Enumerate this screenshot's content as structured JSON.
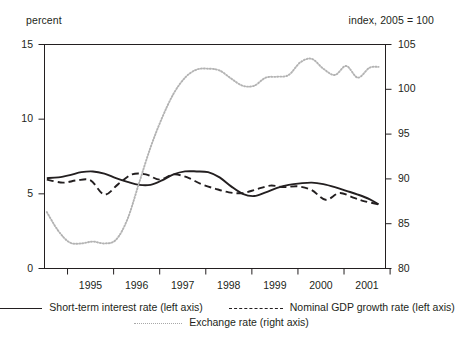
{
  "chart_data": {
    "type": "line",
    "title": "",
    "subtitle": "",
    "left_axis_caption": "percent",
    "right_axis_caption": "index, 2005 = 100",
    "xlabel": "",
    "ylabel": "percent",
    "y2label": "index, 2005 = 100",
    "grid": false,
    "legend_position": "bottom",
    "xlim": [
      1994.5,
      2001.9
    ],
    "ylim": [
      0,
      15
    ],
    "y2lim": [
      80,
      105
    ],
    "yticks": [
      0,
      5,
      10,
      15
    ],
    "y2ticks": [
      80,
      85,
      90,
      95,
      100,
      105
    ],
    "xticks": [
      1995,
      1996,
      1997,
      1998,
      1999,
      2000,
      2001
    ],
    "xticklabels": [
      "1995",
      "1996",
      "1997",
      "1998",
      "1999",
      "2000",
      "2001"
    ],
    "series": [
      {
        "name": "Short-term interest rate (left axis)",
        "axis": "left",
        "style": "solid",
        "color": "#231f20",
        "x": [
          1994.55,
          1994.8,
          1995.05,
          1995.3,
          1995.55,
          1995.8,
          1996.05,
          1996.3,
          1996.55,
          1996.8,
          1997.05,
          1997.3,
          1997.55,
          1997.8,
          1998.05,
          1998.3,
          1998.55,
          1998.8,
          1999.05,
          1999.3,
          1999.55,
          1999.8,
          2000.05,
          2000.3,
          2000.55,
          2000.8,
          2001.05,
          2001.3,
          2001.55,
          2001.75
        ],
        "values": [
          6.05,
          6.1,
          6.25,
          6.45,
          6.5,
          6.35,
          6.05,
          5.8,
          5.6,
          5.6,
          5.9,
          6.3,
          6.5,
          6.5,
          6.45,
          6.1,
          5.5,
          5.0,
          4.85,
          5.1,
          5.4,
          5.6,
          5.7,
          5.75,
          5.65,
          5.45,
          5.2,
          4.95,
          4.65,
          4.3
        ]
      },
      {
        "name": "Nominal GDP growth rate (left axis)",
        "axis": "left",
        "style": "dashed",
        "color": "#231f20",
        "x": [
          1994.55,
          1994.9,
          1995.2,
          1995.5,
          1995.8,
          1996.1,
          1996.4,
          1996.7,
          1997.0,
          1997.3,
          1997.6,
          1997.9,
          1998.2,
          1998.5,
          1998.8,
          1999.1,
          1999.4,
          1999.7,
          2000.0,
          2000.3,
          2000.6,
          2000.9,
          2001.2,
          2001.45,
          2001.75
        ],
        "values": [
          5.95,
          5.75,
          5.9,
          5.9,
          4.95,
          5.65,
          6.3,
          6.3,
          5.95,
          6.3,
          6.1,
          5.65,
          5.35,
          5.1,
          5.05,
          5.3,
          5.55,
          5.45,
          5.5,
          5.25,
          4.6,
          5.05,
          4.75,
          4.5,
          4.3
        ]
      },
      {
        "name": "Exchange rate (right axis)",
        "axis": "right",
        "style": "dotted",
        "color": "#b3b3b3",
        "x": [
          1994.55,
          1994.8,
          1995.05,
          1995.3,
          1995.55,
          1995.8,
          1996.05,
          1996.3,
          1996.55,
          1996.8,
          1997.05,
          1997.3,
          1997.55,
          1997.8,
          1998.05,
          1998.3,
          1998.55,
          1998.8,
          1999.05,
          1999.3,
          1999.55,
          1999.8,
          2000.05,
          2000.3,
          2000.55,
          2000.8,
          2001.05,
          2001.3,
          2001.55,
          2001.75
        ],
        "values": [
          86.3,
          84.2,
          82.9,
          82.8,
          83.0,
          82.8,
          83.2,
          85.5,
          89.5,
          93.5,
          96.8,
          99.5,
          101.3,
          102.2,
          102.3,
          102.1,
          101.2,
          100.4,
          100.4,
          101.3,
          101.4,
          101.6,
          103.0,
          103.4,
          102.3,
          101.6,
          102.6,
          101.3,
          102.4,
          102.5
        ]
      }
    ]
  },
  "legend": {
    "items": [
      {
        "label": "Short-term interest rate (left axis)",
        "style": "solid"
      },
      {
        "label": "Nominal GDP growth rate (left axis)",
        "style": "dashed"
      },
      {
        "label": "Exchange rate (right axis)",
        "style": "dotted"
      }
    ]
  }
}
